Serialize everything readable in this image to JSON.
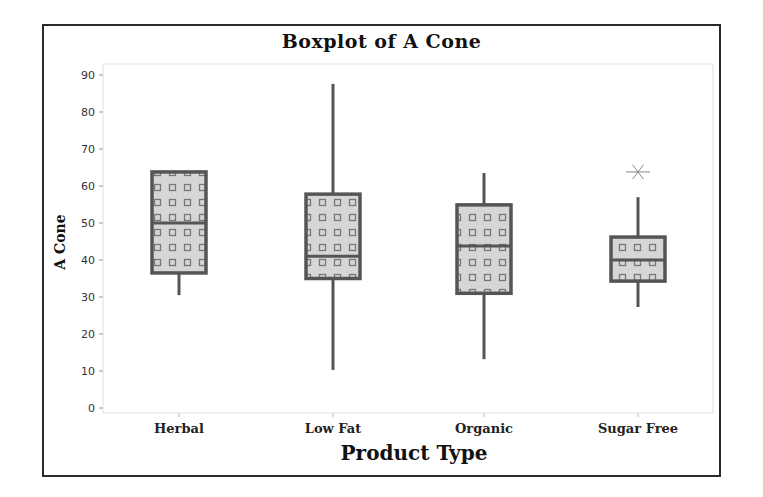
{
  "chart_data": {
    "type": "boxplot",
    "title": "Boxplot of A Cone",
    "xlabel": "Product Type",
    "ylabel": "A Cone",
    "ylim": [
      0,
      90
    ],
    "yticks": [
      0,
      10,
      20,
      30,
      40,
      50,
      60,
      70,
      80,
      90
    ],
    "grid": false,
    "legend": null,
    "categories": [
      "Herbal",
      "Low Fat",
      "Organic",
      "Sugar Free"
    ],
    "series": [
      {
        "name": "Herbal",
        "min": 30.5,
        "q1": 36.5,
        "median": 50,
        "q3": 63.8,
        "max": 63.8,
        "outliers": []
      },
      {
        "name": "Low Fat",
        "min": 10.3,
        "q1": 35,
        "median": 41,
        "q3": 57.8,
        "max": 87.6,
        "outliers": []
      },
      {
        "name": "Organic",
        "min": 13.2,
        "q1": 31,
        "median": 43.8,
        "q3": 54.9,
        "max": 63.5,
        "outliers": []
      },
      {
        "name": "Sugar Free",
        "min": 27.3,
        "q1": 34.3,
        "median": 40,
        "q3": 46.2,
        "max": 57,
        "outliers": [
          63.8
        ]
      }
    ],
    "colors": {
      "box_fill": "#d6d6d6",
      "box_border": "#555555",
      "pattern": "#777777",
      "frame": "#2a2a2a",
      "plot_border": "#dddddd"
    }
  }
}
